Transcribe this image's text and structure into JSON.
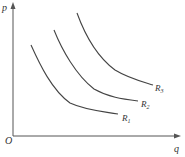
{
  "axes": {
    "y_label": "p",
    "x_label": "q",
    "origin_label": "O"
  },
  "curves": [
    {
      "name": "R",
      "sub": "1"
    },
    {
      "name": "R",
      "sub": "2"
    },
    {
      "name": "R",
      "sub": "3"
    }
  ],
  "colors": {
    "line": "#444444",
    "background": "#ffffff"
  }
}
